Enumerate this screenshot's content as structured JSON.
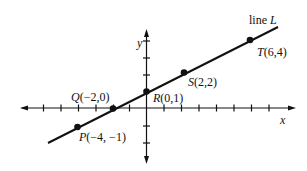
{
  "diagram": {
    "line_label": "line",
    "line_name": "L",
    "x_axis_label": "x",
    "y_axis_label": "y",
    "points": [
      {
        "name": "P",
        "coords": "(−4, −1)",
        "x": -4,
        "y": -1
      },
      {
        "name": "Q",
        "coords": "(−2,0)",
        "x": -2,
        "y": 0
      },
      {
        "name": "R",
        "coords": "(0,1)",
        "x": 0,
        "y": 1
      },
      {
        "name": "S",
        "coords": "(2,2)",
        "x": 2,
        "y": 2
      },
      {
        "name": "T",
        "coords": "(6,4)",
        "x": 6,
        "y": 4
      }
    ],
    "colors": {
      "ink": "#111111",
      "background": "#ffffff"
    }
  }
}
